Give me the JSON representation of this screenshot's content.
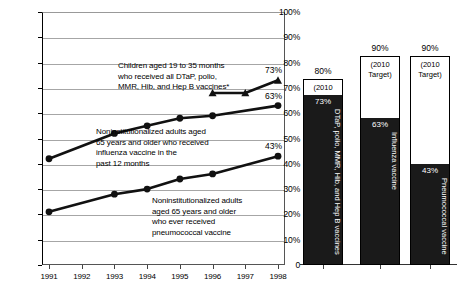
{
  "chart_data": {
    "type": "line",
    "title": "",
    "xlabel": "",
    "ylabel": "",
    "x": [
      1991,
      1992,
      1993,
      1994,
      1995,
      1996,
      1997,
      1998
    ],
    "ylim": [
      0,
      100
    ],
    "ytick_labels": [
      "0",
      "10%",
      "20%",
      "30%",
      "40%",
      "50%",
      "60%",
      "70%",
      "80%",
      "90%",
      "100%"
    ],
    "ytick_values": [
      0,
      10,
      20,
      30,
      40,
      50,
      60,
      70,
      80,
      90,
      100
    ],
    "grid": true,
    "legend": "none",
    "series": [
      {
        "name": "Children aged 19 to 35 months who received all DTaP, polio, MMR, Hib, and Hep B vaccines*",
        "marker": "triangle",
        "x": [
          1996,
          1997,
          1998
        ],
        "values": [
          68,
          68,
          73
        ],
        "end_label": "73%"
      },
      {
        "name": "Noninstitutionalized adults aged 65 years and older who received influenza vaccine in the past 12 months",
        "marker": "circle",
        "x": [
          1991,
          1993,
          1994,
          1995,
          1996,
          1998
        ],
        "values": [
          42,
          52,
          55,
          58,
          59,
          63
        ],
        "end_label": "63%"
      },
      {
        "name": "Noninstitutionalized adults aged 65 years and older who ever received pneumococcal vaccine",
        "marker": "circle",
        "x": [
          1991,
          1993,
          1994,
          1995,
          1996,
          1998
        ],
        "values": [
          21,
          28,
          30,
          34,
          36,
          43
        ],
        "end_label": "43%"
      }
    ],
    "annotations": [
      {
        "id": "annot-dtap",
        "lines": [
          "Children aged 19 to 35 months",
          "who received all DTaP, polio,",
          "MMR, Hib, and Hep B vaccines*"
        ]
      },
      {
        "id": "annot-influenza",
        "lines": [
          "Noninstitutionalized  adults aged",
          "65 years and older who received",
          "influenza vaccine in the",
          "past 12 months"
        ]
      },
      {
        "id": "annot-pneumococcal",
        "lines": [
          "Noninstitutionalized adults",
          "aged 65 years and older",
          "who ever received",
          "pneumococcal vaccine"
        ]
      }
    ],
    "target_bars": {
      "type": "bar",
      "ylim": [
        0,
        100
      ],
      "target_caption_line1": "(2010",
      "target_caption_line2": "Target)",
      "bars": [
        {
          "label": "DTaP, polio, MMR, Hib, and Hep B vaccines",
          "target_pct": "80%",
          "target_value": 80,
          "value_pct": "73%",
          "value": 73
        },
        {
          "label": "Influenza vaccine",
          "target_pct": "90%",
          "target_value": 90,
          "value_pct": "63%",
          "value": 63
        },
        {
          "label": "Pneumococcal vaccine",
          "target_pct": "90%",
          "target_value": 90,
          "value_pct": "43%",
          "value": 43
        }
      ]
    },
    "colors": {
      "series_line": "#111111",
      "bar_fill": "#1a1a1a",
      "grid": "#a6a6a6",
      "axis": "#333333",
      "background": "#ffffff"
    }
  }
}
